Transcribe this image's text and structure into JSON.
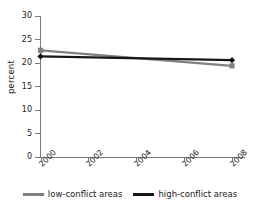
{
  "chart_data": {
    "type": "line",
    "title": "",
    "xlabel": "",
    "ylabel": "percent",
    "x": [
      2000,
      2008
    ],
    "xlim": [
      2000,
      2008
    ],
    "ylim": [
      0,
      30
    ],
    "ytick_labels": [
      "30",
      "25",
      "20",
      "15",
      "10",
      "5",
      "0"
    ],
    "ytick_values": [
      30,
      25,
      20,
      15,
      10,
      5,
      0
    ],
    "xtick_labels": [
      "2000",
      "2002",
      "2004",
      "2006",
      "2008"
    ],
    "xtick_values": [
      2000,
      2002,
      2004,
      2006,
      2008
    ],
    "grid": false,
    "legend_position": "bottom",
    "series": [
      {
        "name": "low-conflict areas",
        "color": "#808080",
        "marker": "square",
        "values": [
          22.7,
          19.4
        ]
      },
      {
        "name": "high-conflict areas",
        "color": "#161616",
        "marker": "diamond",
        "values": [
          21.4,
          20.6
        ]
      }
    ]
  },
  "legend": {
    "entries": [
      {
        "label": "low-conflict areas",
        "color": "#808080"
      },
      {
        "label": "high-conflict areas",
        "color": "#161616"
      }
    ]
  },
  "colors": {
    "low_conflict": "#808080",
    "high_conflict": "#161616",
    "axis": "#7d7d7d",
    "text": "#1a1a1a",
    "background": "#ffffff"
  }
}
